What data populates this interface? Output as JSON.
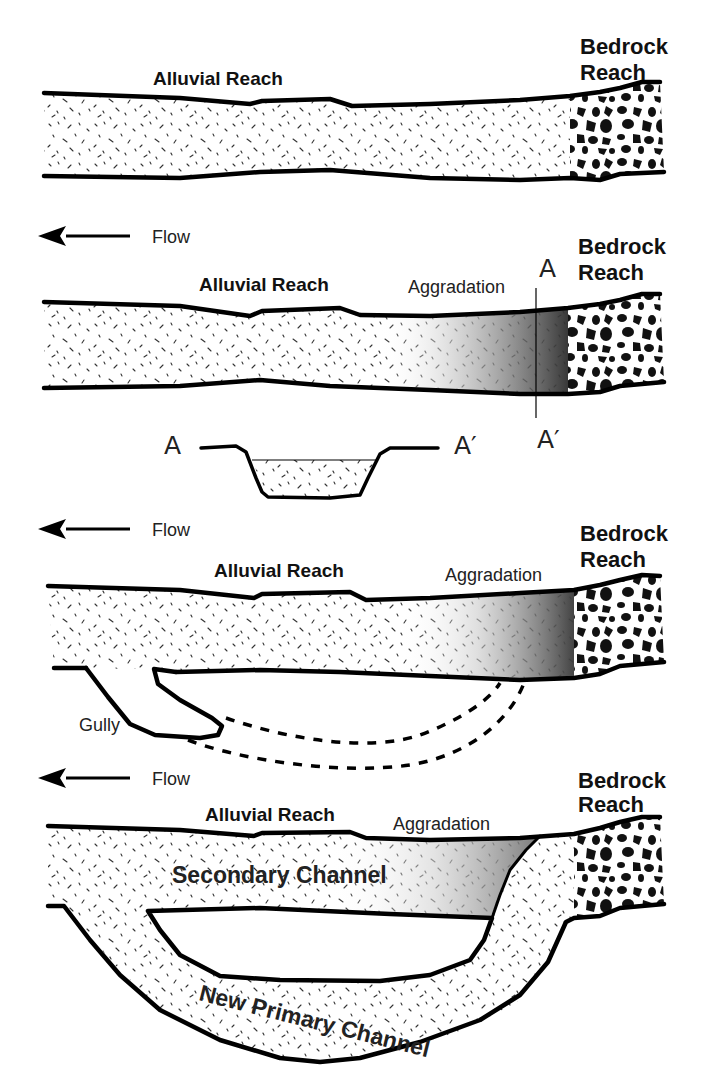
{
  "diagram": {
    "title": "",
    "panels": [
      {
        "id": "panel-1",
        "labels": {
          "alluvial": "Alluvial Reach",
          "bedrock_line1": "Bedrock",
          "bedrock_line2": "Reach"
        }
      },
      {
        "id": "panel-2",
        "labels": {
          "flow": "Flow",
          "alluvial": "Alluvial Reach",
          "aggradation": "Aggradation",
          "section_top": "A",
          "section_bottom": "A′",
          "bedrock_line1": "Bedrock",
          "bedrock_line2": "Reach"
        },
        "cross_section": {
          "left_label": "A",
          "right_label": "A′"
        }
      },
      {
        "id": "panel-3",
        "labels": {
          "flow": "Flow",
          "alluvial": "Alluvial Reach",
          "aggradation": "Aggradation",
          "gully": "Gully",
          "bedrock_line1": "Bedrock",
          "bedrock_line2": "Reach"
        }
      },
      {
        "id": "panel-4",
        "labels": {
          "flow": "Flow",
          "alluvial": "Alluvial Reach",
          "aggradation": "Aggradation",
          "secondary_channel": "Secondary Channel",
          "new_primary_channel": "New Primary Channel",
          "bedrock_line1": "Bedrock",
          "bedrock_line2": "Reach"
        }
      }
    ],
    "colors": {
      "line": "#000000",
      "sand_fill": "#ffffff",
      "aggradation_dark": "#3a3a3a",
      "background": "#ffffff"
    }
  }
}
